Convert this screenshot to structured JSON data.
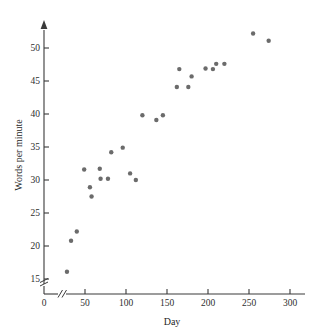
{
  "figure": {
    "kind": "scatter-plot",
    "background_color": "#ffffff",
    "point_color": "#6b6b6b",
    "axis_color": "#3a3a3a",
    "text_color": "#2e2e2e"
  },
  "chart_data": {
    "type": "scatter",
    "title": "",
    "xlabel": "Day",
    "ylabel": "Words per minute",
    "xlim": [
      0,
      310
    ],
    "ylim": [
      13,
      53
    ],
    "grid": false,
    "legend": null,
    "x_ticks": [
      0,
      50,
      100,
      150,
      200,
      250,
      300
    ],
    "x_tick_labels": [
      "0",
      "50",
      "100",
      "150",
      "200",
      "250",
      "300"
    ],
    "y_ticks": [
      15,
      20,
      25,
      30,
      35,
      40,
      45,
      50
    ],
    "y_tick_labels": [
      "15",
      "20",
      "25",
      "30",
      "35",
      "40",
      "45",
      "50"
    ],
    "axis_breaks": {
      "x_axis_break": true,
      "y_axis_break": true,
      "x_break_between": [
        0,
        25
      ],
      "y_break_below": 15
    },
    "points": [
      {
        "x": 28,
        "y": 16.1
      },
      {
        "x": 33,
        "y": 20.8
      },
      {
        "x": 40,
        "y": 22.2
      },
      {
        "x": 49,
        "y": 31.6
      },
      {
        "x": 56,
        "y": 28.9
      },
      {
        "x": 58,
        "y": 27.5
      },
      {
        "x": 68,
        "y": 31.7
      },
      {
        "x": 69,
        "y": 30.2
      },
      {
        "x": 78,
        "y": 30.2
      },
      {
        "x": 82,
        "y": 34.2
      },
      {
        "x": 96,
        "y": 34.9
      },
      {
        "x": 105,
        "y": 31.0
      },
      {
        "x": 112,
        "y": 30.0
      },
      {
        "x": 120,
        "y": 39.8
      },
      {
        "x": 137,
        "y": 39.1
      },
      {
        "x": 145,
        "y": 39.8
      },
      {
        "x": 162,
        "y": 44.1
      },
      {
        "x": 165,
        "y": 46.8
      },
      {
        "x": 176,
        "y": 44.1
      },
      {
        "x": 180,
        "y": 45.7
      },
      {
        "x": 197,
        "y": 46.9
      },
      {
        "x": 206,
        "y": 46.8
      },
      {
        "x": 210,
        "y": 47.6
      },
      {
        "x": 220,
        "y": 47.6
      },
      {
        "x": 255,
        "y": 52.2
      },
      {
        "x": 274,
        "y": 51.1
      }
    ]
  }
}
